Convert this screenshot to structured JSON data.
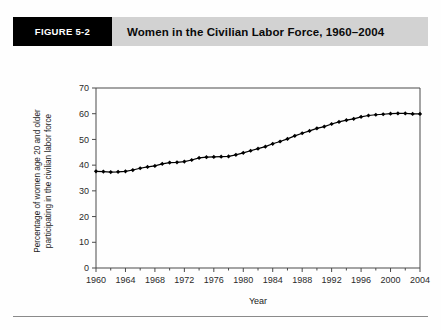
{
  "figure": {
    "number_label": "FIGURE 5-2",
    "title": "Women in the Civilian Labor Force, 1960–2004"
  },
  "chart_data": {
    "type": "line",
    "title": "Women in the Civilian Labor Force, 1960–2004",
    "xlabel": "Year",
    "ylabel": "Percentage of women age 20 and older participating in the civilian labor force",
    "ylabel_line1": "Percentage of women age 20 and older",
    "ylabel_line2": "participating in the civilian labor force",
    "xlim": [
      1960,
      2004
    ],
    "ylim": [
      0,
      70
    ],
    "ytick_labels": [
      "0",
      "10",
      "20",
      "30",
      "40",
      "50",
      "60",
      "70"
    ],
    "yticks": [
      0,
      10,
      20,
      30,
      40,
      50,
      60,
      70
    ],
    "xtick_labels": [
      "1960",
      "1964",
      "1968",
      "1972",
      "1976",
      "1980",
      "1984",
      "1988",
      "1992",
      "1996",
      "2000",
      "2004"
    ],
    "xticks": [
      1960,
      1964,
      1968,
      1972,
      1976,
      1980,
      1984,
      1988,
      1992,
      1996,
      2000,
      2004
    ],
    "grid": false,
    "legend": false,
    "marker": "diamond",
    "line_color": "#000000",
    "x": [
      1960,
      1961,
      1962,
      1963,
      1964,
      1965,
      1966,
      1967,
      1968,
      1969,
      1970,
      1971,
      1972,
      1973,
      1974,
      1975,
      1976,
      1977,
      1978,
      1979,
      1980,
      1981,
      1982,
      1983,
      1984,
      1985,
      1986,
      1987,
      1988,
      1989,
      1990,
      1991,
      1992,
      1993,
      1994,
      1995,
      1996,
      1997,
      1998,
      1999,
      2000,
      2001,
      2002,
      2003,
      2004
    ],
    "values": [
      37.6,
      37.5,
      37.3,
      37.4,
      37.6,
      38.1,
      38.8,
      39.3,
      39.7,
      40.5,
      41.0,
      41.1,
      41.4,
      42.0,
      42.8,
      43.1,
      43.2,
      43.3,
      43.4,
      44.0,
      44.8,
      45.6,
      46.4,
      47.2,
      48.3,
      49.2,
      50.2,
      51.4,
      52.4,
      53.3,
      54.3,
      55.0,
      56.0,
      56.8,
      57.5,
      58.0,
      58.8,
      59.3,
      59.6,
      59.8,
      60.0,
      60.1,
      60.1,
      59.9,
      59.9
    ]
  }
}
